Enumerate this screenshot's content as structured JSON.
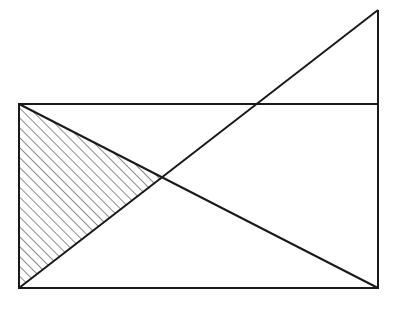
{
  "diagram": {
    "type": "geometry",
    "stroke_color": "#1a1a1a",
    "background": "#ffffff",
    "points": {
      "rect_top_left": [
        19,
        104
      ],
      "rect_top_right": [
        378,
        104
      ],
      "rect_bottom_left": [
        19,
        288
      ],
      "rect_bottom_right": [
        378,
        288
      ],
      "apex": [
        378,
        10
      ],
      "intersection": [
        163,
        178
      ]
    },
    "shaded_region": [
      "rect_top_left",
      "intersection",
      "rect_bottom_left"
    ],
    "hatch_style": "diagonal lines"
  }
}
